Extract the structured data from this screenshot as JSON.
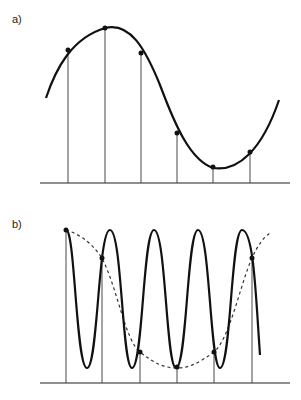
{
  "panels": [
    {
      "label": "a)",
      "description": "Low-frequency sine wave sampled at regular intervals"
    },
    {
      "label": "b)",
      "description": "High-frequency sine wave sampled at same intervals, producing an aliased low-frequency reconstruction (dashed)"
    }
  ],
  "colors": {
    "curve": "#111111",
    "sample_line": "#333333",
    "axis": "#222222",
    "dashed": "#333333"
  },
  "sample_x": [
    66,
    102,
    140,
    177,
    214,
    252
  ],
  "panel_a_points_y": [
    50,
    28,
    53,
    133,
    167,
    152
  ],
  "panel_b_points_y": [
    230,
    258,
    352,
    367,
    352,
    258
  ]
}
